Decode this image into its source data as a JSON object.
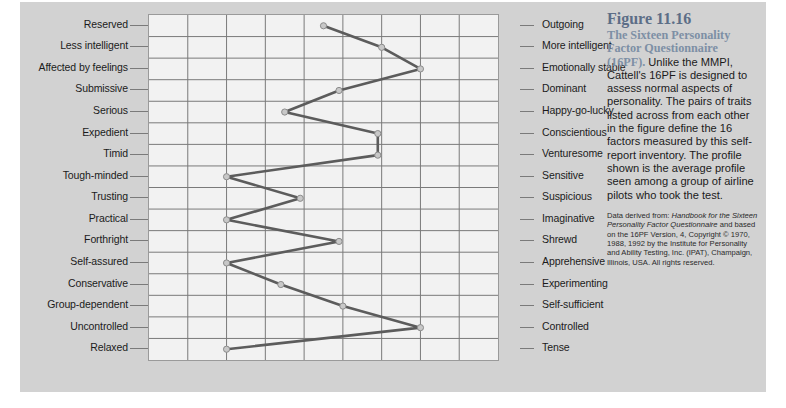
{
  "figure": {
    "number_title": "Figure 11.16",
    "lead_in": "The Sixteen Personality Factor Questionnaire (16PF).",
    "body": " Unlike the MMPI, Cattell's 16PF is designed to assess normal aspects of personality. The pairs of traits listed across from each other in the figure define the 16 factors measured by this self-report inventory. The profile shown is the average profile seen among a group of airline pilots who took the test.",
    "source_prefix": "Data derived from: ",
    "source_italic_1": "Handbook for the Sixteen Personality Factor Questionnaire",
    "source_mid": " and based on the 16PF Version, 4, Copyright © 1970, 1988, 1992 by the Institute for Personality and Ability Testing, Inc. (IPAT), Champaign, Illinois, USA. All rights reserved."
  },
  "colors": {
    "panel_background": "#d2d2d2",
    "plot_background": "#f2f2f2",
    "grid_line": "#7a7a7a",
    "plot_border": "#9a9a9a",
    "profile_line": "#5c5c5c",
    "marker_fill": "#c8c8c8",
    "marker_stroke": "#8c8c8c",
    "caption_accent": "#5c6e87",
    "text": "#1b1b1b"
  },
  "chart_data": {
    "type": "line",
    "title": "Figure 11.16",
    "orientation": "horizontal-profile",
    "xlabel": "",
    "ylabel": "",
    "xlim": [
      1,
      10
    ],
    "grid": true,
    "legend": false,
    "categories": [
      "Reserved / Outgoing",
      "Less intelligent / More intelligent",
      "Affected by feelings / Emotionally stable",
      "Submissive / Dominant",
      "Serious / Happy-go-lucky",
      "Expedient / Conscientious",
      "Timid / Venturesome",
      "Tough-minded / Sensitive",
      "Trusting / Suspicious",
      "Practical / Imaginative",
      "Forthright / Shrewd",
      "Self-assured / Apprehensive",
      "Conservative / Experimenting",
      "Group-dependent / Self-sufficient",
      "Uncontrolled / Controlled",
      "Relaxed / Tense"
    ],
    "left_labels": [
      "Reserved",
      "Less intelligent",
      "Affected by feelings",
      "Submissive",
      "Serious",
      "Expedient",
      "Timid",
      "Tough-minded",
      "Trusting",
      "Practical",
      "Forthright",
      "Self-assured",
      "Conservative",
      "Group-dependent",
      "Uncontrolled",
      "Relaxed"
    ],
    "right_labels": [
      "Outgoing",
      "More intelligent",
      "Emotionally stable",
      "Dominant",
      "Happy-go-lucky",
      "Conscientious",
      "Venturesome",
      "Sensitive",
      "Suspicious",
      "Imaginative",
      "Shrewd",
      "Apprehensive",
      "Experimenting",
      "Self-sufficient",
      "Controlled",
      "Tense"
    ],
    "series": [
      {
        "name": "Average profile of airline pilots",
        "values": [
          5.5,
          7.0,
          8.0,
          5.9,
          4.5,
          6.9,
          6.9,
          3.0,
          4.9,
          3.0,
          5.9,
          3.0,
          4.4,
          6.0,
          8.0,
          3.0
        ]
      }
    ]
  }
}
